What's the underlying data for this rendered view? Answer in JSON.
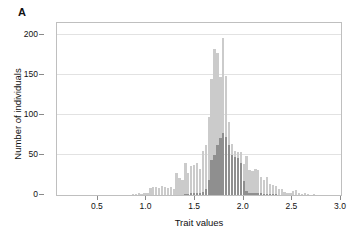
{
  "figure": {
    "panel_label": "A",
    "background_color": "#ffffff"
  },
  "chart_data": {
    "type": "bar",
    "subtype": "overlaid-histogram",
    "title": "",
    "xlabel": "Trait values",
    "ylabel": "Number of individuals",
    "xlim": [
      0.08,
      3.0
    ],
    "ylim": [
      0,
      215
    ],
    "bin_width": 0.03,
    "grid": true,
    "grid_axis": "y",
    "legend": "none",
    "x_ticks": [
      0.5,
      1.0,
      1.5,
      2.0,
      2.5,
      3.0
    ],
    "x_tick_labels": [
      "0.5",
      "1.0",
      "1.5",
      "2.0",
      "2.5",
      "3.0"
    ],
    "y_ticks": [
      0,
      50,
      100,
      150,
      200
    ],
    "y_tick_labels": [
      "0",
      "50",
      "100",
      "150",
      "200"
    ],
    "colors": {
      "series_all": "#cbcbcb",
      "series_subset": "#8f8f8f",
      "axis": "#bfbfbf",
      "grid": "#e2e2e2",
      "text": "#111111"
    },
    "x": [
      0.86,
      0.89,
      0.92,
      0.95,
      0.98,
      1.01,
      1.04,
      1.07,
      1.1,
      1.13,
      1.16,
      1.19,
      1.22,
      1.25,
      1.28,
      1.31,
      1.34,
      1.37,
      1.4,
      1.43,
      1.46,
      1.49,
      1.52,
      1.55,
      1.58,
      1.61,
      1.64,
      1.67,
      1.7,
      1.73,
      1.76,
      1.79,
      1.82,
      1.85,
      1.88,
      1.91,
      1.94,
      1.97,
      2.0,
      2.03,
      2.06,
      2.09,
      2.12,
      2.15,
      2.18,
      2.21,
      2.24,
      2.27,
      2.3,
      2.33,
      2.36,
      2.39,
      2.42,
      2.45,
      2.48,
      2.51,
      2.54,
      2.57,
      2.6,
      2.63,
      2.66,
      2.69,
      2.72
    ],
    "series": [
      {
        "name": "All individuals",
        "color": "#cbcbcb",
        "values": [
          1,
          1,
          2,
          1,
          2,
          3,
          9,
          10,
          10,
          9,
          11,
          10,
          9,
          10,
          8,
          28,
          21,
          19,
          40,
          28,
          36,
          37,
          40,
          33,
          55,
          62,
          97,
          145,
          182,
          178,
          148,
          196,
          149,
          91,
          64,
          55,
          54,
          54,
          39,
          49,
          31,
          30,
          33,
          31,
          22,
          19,
          23,
          14,
          12,
          11,
          8,
          7,
          4,
          3,
          3,
          5,
          6,
          3,
          1,
          2,
          1,
          0,
          1
        ]
      },
      {
        "name": "Subset of individuals",
        "color": "#8f8f8f",
        "values": [
          0,
          0,
          0,
          0,
          0,
          0,
          0,
          0,
          0,
          0,
          0,
          0,
          0,
          0,
          0,
          0,
          0,
          0,
          1,
          1,
          2,
          2,
          3,
          3,
          4,
          7,
          19,
          44,
          50,
          63,
          71,
          78,
          72,
          63,
          50,
          47,
          46,
          40,
          18,
          5,
          3,
          3,
          3,
          2,
          2,
          1,
          1,
          1,
          1,
          1,
          0,
          0,
          0,
          0,
          0,
          0,
          0,
          0,
          0,
          0,
          0,
          0,
          0
        ]
      }
    ]
  }
}
